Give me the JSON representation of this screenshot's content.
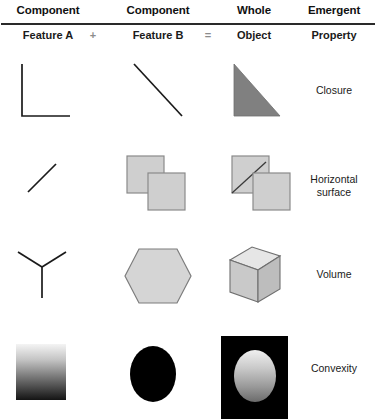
{
  "header": {
    "columns": [
      {
        "title": "Component",
        "subtitle": "Feature A"
      },
      {
        "title": "Component",
        "subtitle": "Feature B"
      },
      {
        "title": "Whole",
        "subtitle": "Object"
      },
      {
        "title": "Emergent",
        "subtitle": "Property"
      }
    ],
    "operators": {
      "plus": "+",
      "equals": "="
    }
  },
  "rows": [
    {
      "id": "closure",
      "label": "Closure",
      "feature_a": "right-angle-corner-lines",
      "feature_b": "diagonal-line-descending",
      "whole": "filled-right-triangle"
    },
    {
      "id": "horizontal-surface",
      "label": "Horizontal\nsurface",
      "feature_a": "short-diagonal-line-ascending",
      "feature_b": "two-overlapping-squares",
      "whole": "overlapping-squares-with-diagonal"
    },
    {
      "id": "volume",
      "label": "Volume",
      "feature_a": "y-junction-lines",
      "feature_b": "filled-hexagon",
      "whole": "shaded-cube"
    },
    {
      "id": "convexity",
      "label": "Convexity",
      "feature_a": "vertical-gradient-square",
      "feature_b": "black-ellipse",
      "whole": "gradient-ellipse-on-black-square"
    }
  ],
  "colors": {
    "line": "#1a1a1a",
    "triangle_fill": "#808080",
    "square_fill": "#cfcfcf",
    "square_stroke": "#8a8a8a",
    "hexagon_fill": "#d5d5d5",
    "hexagon_stroke": "#7d7d7d",
    "cube_top": "#e2e2e2",
    "cube_left": "#c8c8c8",
    "cube_right": "#bdbdbd",
    "black": "#000000",
    "gradient_light": "#f2f2f2",
    "gradient_dark": "#141414",
    "rule": "#2a2a2a",
    "operator": "#8c8c8c"
  }
}
